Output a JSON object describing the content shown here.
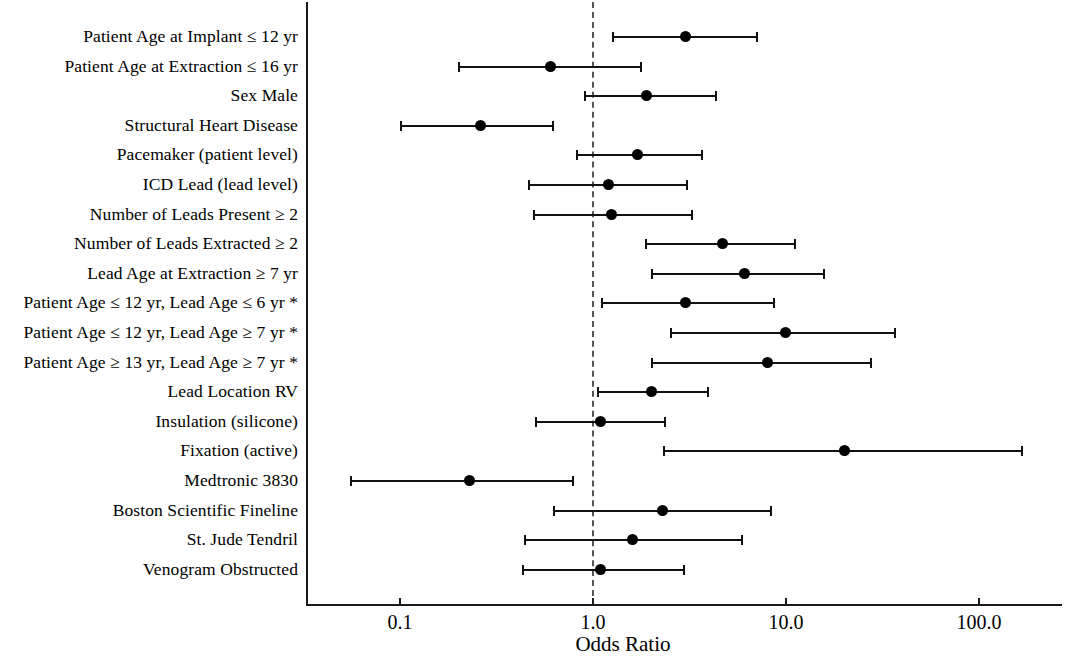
{
  "chart_data": {
    "type": "scatter",
    "subtype": "forest-plot",
    "title": "",
    "xlabel": "Odds Ratio",
    "ylabel": "",
    "xscale": "log",
    "xlim": [
      0.04,
      250.0
    ],
    "grid": false,
    "legend": null,
    "reference_line": 1.0,
    "xticks": [
      0.1,
      1.0,
      10.0,
      100.0
    ],
    "xtick_labels": [
      "0.1",
      "1.0",
      "10.0",
      "100.0"
    ],
    "footnote_marker": "*",
    "categories": [
      "Patient Age at Implant ≤ 12 yr",
      "Patient Age at Extraction ≤ 16 yr",
      "Sex Male",
      "Structural Heart Disease",
      "Pacemaker (patient level)",
      "ICD Lead (lead level)",
      "Number of Leads Present ≥ 2",
      "Number of Leads Extracted ≥ 2",
      "Lead Age at Extraction ≥ 7 yr",
      "Patient Age ≤ 12 yr, Lead Age ≤ 6 yr *",
      "Patient Age ≤ 12 yr, Lead Age ≥ 7 yr *",
      "Patient Age ≥ 13 yr, Lead Age ≥ 7 yr *",
      "Lead Location RV",
      "Insulation (silicone)",
      "Fixation (active)",
      "Medtronic 3830",
      "Boston Scientific Fineline",
      "St. Jude Tendril",
      "Venogram Obstructed"
    ],
    "rows": [
      {
        "label": "Patient Age at Implant ≤ 12 yr",
        "or": 3.0,
        "lo": 1.25,
        "hi": 7.2
      },
      {
        "label": "Patient Age at Extraction ≤ 16 yr",
        "or": 0.6,
        "lo": 0.2,
        "hi": 1.8
      },
      {
        "label": "Sex Male",
        "or": 1.9,
        "lo": 0.9,
        "hi": 4.4
      },
      {
        "label": "Structural Heart Disease",
        "or": 0.26,
        "lo": 0.1,
        "hi": 0.63
      },
      {
        "label": "Pacemaker (patient level)",
        "or": 1.7,
        "lo": 0.82,
        "hi": 3.7
      },
      {
        "label": "ICD Lead (lead level)",
        "or": 1.2,
        "lo": 0.46,
        "hi": 3.1
      },
      {
        "label": "Number of Leads Present ≥ 2",
        "or": 1.25,
        "lo": 0.49,
        "hi": 3.3
      },
      {
        "label": "Number of Leads Extracted ≥ 2",
        "or": 4.7,
        "lo": 1.85,
        "hi": 11.3
      },
      {
        "label": "Lead Age at Extraction ≥ 7 yr",
        "or": 6.1,
        "lo": 2.0,
        "hi": 16.0
      },
      {
        "label": "Patient Age ≤ 12 yr, Lead Age ≤ 6 yr *",
        "or": 3.0,
        "lo": 1.1,
        "hi": 8.8
      },
      {
        "label": "Patient Age ≤ 12 yr, Lead Age ≥ 7 yr *",
        "or": 10.0,
        "lo": 2.5,
        "hi": 37.0
      },
      {
        "label": "Patient Age ≥ 13 yr, Lead Age ≥ 7 yr *",
        "or": 8.0,
        "lo": 2.0,
        "hi": 28.0
      },
      {
        "label": "Lead Location RV",
        "or": 2.0,
        "lo": 1.05,
        "hi": 4.0
      },
      {
        "label": "Insulation (silicone)",
        "or": 1.1,
        "lo": 0.5,
        "hi": 2.4
      },
      {
        "label": "Fixation (active)",
        "or": 20.0,
        "lo": 2.3,
        "hi": 170.0
      },
      {
        "label": "Medtronic 3830",
        "or": 0.23,
        "lo": 0.055,
        "hi": 0.8
      },
      {
        "label": "Boston Scientific Fineline",
        "or": 2.3,
        "lo": 0.62,
        "hi": 8.5
      },
      {
        "label": "St. Jude Tendril",
        "or": 1.6,
        "lo": 0.44,
        "hi": 6.0
      },
      {
        "label": "Venogram Obstructed",
        "or": 1.1,
        "lo": 0.43,
        "hi": 3.0
      }
    ]
  },
  "colors": {
    "axis": "#1a1a1a",
    "reference_line": "#555555",
    "marker": "#000000",
    "ci_line": "#111111",
    "background": "#ffffff"
  }
}
